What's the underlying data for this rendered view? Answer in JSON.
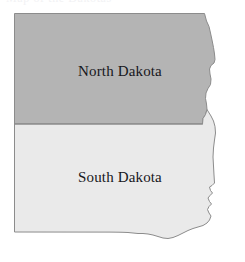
{
  "figure": {
    "kind": "choropleth-outline-map",
    "background_color": "#ffffff",
    "title_artifact": "Map of the Dakotas"
  },
  "map": {
    "name": "the-dakotas",
    "border_color": "#8c8c8c",
    "border_width": 1,
    "divider_color": "#8c8c8c",
    "states": [
      {
        "id": "north-dakota",
        "label": "North Dakota",
        "fill_color": "#b4b4b4",
        "label_color": "#17171c",
        "label_x": 120,
        "label_y": 73,
        "position": "north"
      },
      {
        "id": "south-dakota",
        "label": "South Dakota",
        "fill_color": "#eaeaea",
        "label_color": "#17171c",
        "label_x": 120,
        "label_y": 179,
        "position": "south"
      }
    ],
    "divider": {
      "id": "nd-sd-boundary",
      "y": 124,
      "x_start": 14,
      "x_end": 203
    }
  }
}
